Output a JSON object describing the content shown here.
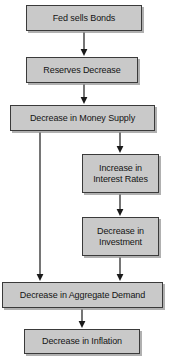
{
  "diagram": {
    "colors": {
      "node_fill": "#c9c9c9",
      "node_border": "#3a3a3a",
      "node_shadow": "#969696",
      "arrow": "#1a1a1a",
      "background": "#ffffff",
      "text": "#141414"
    },
    "nodes": [
      {
        "id": "fed-sells-bonds",
        "name": "node-fed-sells-bonds",
        "label": "Fed sells Bonds",
        "x": 26,
        "y": 5,
        "w": 116,
        "h": 26
      },
      {
        "id": "reserves-decrease",
        "name": "node-reserves-decrease",
        "label": "Reserves Decrease",
        "x": 26,
        "y": 57,
        "w": 112,
        "h": 26
      },
      {
        "id": "decrease-money-supply",
        "name": "node-decrease-in-money-supply",
        "label": "Decrease in Money Supply",
        "x": 10,
        "y": 105,
        "w": 145,
        "h": 26
      },
      {
        "id": "increase-interest-rates",
        "name": "node-increase-in-interest-rates",
        "label": "Increase in\nInterest Rates",
        "x": 82,
        "y": 154,
        "w": 77,
        "h": 39
      },
      {
        "id": "decrease-investment",
        "name": "node-decrease-in-investment",
        "label": "Decrease in\nInvestment",
        "x": 82,
        "y": 217,
        "w": 77,
        "h": 39
      },
      {
        "id": "decrease-aggregate-demand",
        "name": "node-decrease-in-aggregate-demand",
        "label": "Decrease in Aggregate Demand",
        "x": 2,
        "y": 282,
        "w": 161,
        "h": 26
      },
      {
        "id": "decrease-inflation",
        "name": "node-decrease-in-inflation",
        "label": "Decrease in Inflation",
        "x": 24,
        "y": 329,
        "w": 116,
        "h": 25
      }
    ],
    "edges": [
      {
        "id": "e1",
        "name": "arrow-bonds-to-reserves",
        "from": "fed-sells-bonds",
        "to": "reserves-decrease",
        "path": "M 84 32 L 84 50",
        "head_x": 84,
        "head_y": 56
      },
      {
        "id": "e2",
        "name": "arrow-reserves-to-money-supply",
        "from": "reserves-decrease",
        "to": "decrease-money-supply",
        "path": "M 84 84 L 84 98",
        "head_x": 84,
        "head_y": 104
      },
      {
        "id": "e3",
        "name": "arrow-money-supply-to-interest-rates",
        "from": "decrease-money-supply",
        "to": "increase-interest-rates",
        "path": "M 120 132 L 120 147",
        "head_x": 120,
        "head_y": 153
      },
      {
        "id": "e4",
        "name": "arrow-interest-rates-to-investment",
        "from": "increase-interest-rates",
        "to": "decrease-investment",
        "path": "M 120 194 L 120 210",
        "head_x": 120,
        "head_y": 216
      },
      {
        "id": "e5",
        "name": "arrow-investment-to-aggregate-demand",
        "from": "decrease-investment",
        "to": "decrease-aggregate-demand",
        "path": "M 120 257 L 120 275",
        "head_x": 120,
        "head_y": 281
      },
      {
        "id": "e6",
        "name": "arrow-money-supply-to-aggregate-demand",
        "from": "decrease-money-supply",
        "to": "decrease-aggregate-demand",
        "path": "M 40 132 L 40 275",
        "head_x": 40,
        "head_y": 281
      },
      {
        "id": "e7",
        "name": "arrow-aggregate-demand-to-inflation",
        "from": "decrease-aggregate-demand",
        "to": "decrease-inflation",
        "path": "M 82 309 L 82 322",
        "head_x": 82,
        "head_y": 328
      }
    ]
  }
}
